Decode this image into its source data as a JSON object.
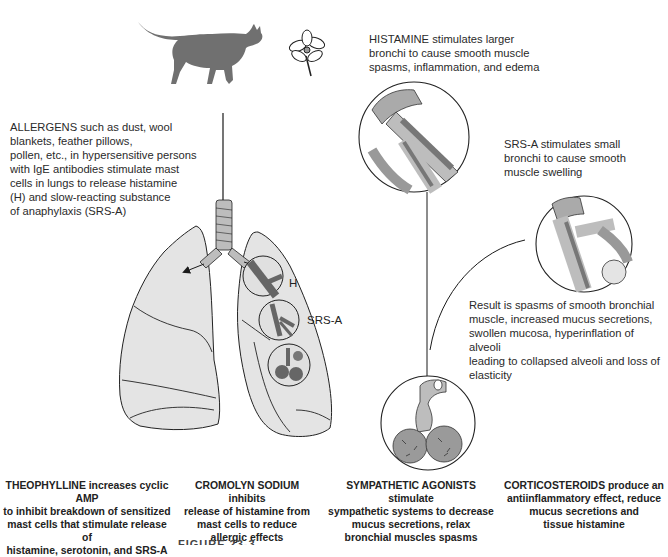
{
  "figure": {
    "caption_partial": "FIGURE 23-3"
  },
  "illustrations": {
    "allergen_icons": [
      "cat-silhouette",
      "flower"
    ],
    "lung_labels": {
      "histamine": "H",
      "srsa": "SRS-A"
    }
  },
  "annotations": {
    "allergens": {
      "lines": [
        "ALLERGENS such as dust, wool",
        "blankets, feather pillows,",
        "pollen, etc., in hypersensitive persons",
        "with IgE antibodies stimulate mast",
        "cells in lungs to release histamine",
        "(H) and slow-reacting substance",
        "of anaphylaxis (SRS-A)"
      ]
    },
    "histamine": {
      "lines": [
        "HISTAMINE stimulates larger",
        "bronchi to cause smooth muscle",
        "spasms, inflammation, and edema"
      ]
    },
    "srsa": {
      "lines": [
        "SRS-A stimulates small",
        "bronchi to cause smooth",
        "muscle swelling"
      ]
    },
    "result": {
      "lines": [
        "Result is spasms of smooth bronchial",
        "muscle, increased mucus secretions,",
        "swollen mucosa, hyperinflation of alveoli",
        "leading to collapsed alveoli and loss of",
        "elasticity"
      ]
    }
  },
  "drugs": [
    {
      "name": "THEOPHYLLINE",
      "lines": [
        "THEOPHYLLINE increases cyclic AMP",
        "to inhibit breakdown of sensitized",
        "mast cells that stimulate release of",
        "histamine, serotonin, and SRS-A"
      ]
    },
    {
      "name": "CROMOLYN SODIUM",
      "lines": [
        "CROMOLYN SODIUM inhibits",
        "release of histamine from",
        "mast cells to reduce",
        "allergic effects"
      ]
    },
    {
      "name": "SYMPATHETIC AGONISTS",
      "lines": [
        "SYMPATHETIC AGONISTS stimulate",
        "sympathetic systems to decrease",
        "mucus secretions, relax",
        "bronchial muscles spasms"
      ]
    },
    {
      "name": "CORTICOSTEROIDS",
      "lines": [
        "CORTICOSTEROIDS produce an",
        "antiinflammatory effect, reduce",
        "mucus secretions and",
        "tissue histamine"
      ]
    }
  ],
  "colors": {
    "lung_fill": "#e4e4e4",
    "bronchi_dark": "#6e6e6e",
    "cat": "#707070",
    "line": "#1a1a1a"
  }
}
